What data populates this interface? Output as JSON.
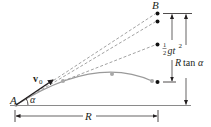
{
  "diagram": {
    "type": "projectile-motion",
    "labels": {
      "origin": "A",
      "target": "B",
      "velocity": "v",
      "velocity_sub": "0",
      "angle": "α",
      "range": "R",
      "drop_half": "1",
      "drop_den": "2",
      "drop_g": "gt",
      "drop_exp": "2",
      "height_R": "R",
      "height_tan": "tan",
      "height_alpha": "α"
    },
    "colors": {
      "ink": "#231f20",
      "trajectory": "#9a9a9a",
      "dashed": "#8a8a8a",
      "gray_dot": "#a8a8a8",
      "black_dot": "#111111"
    },
    "black_dots": [
      {
        "x": 157,
        "y": 13
      },
      {
        "x": 157,
        "y": 21
      },
      {
        "x": 157,
        "y": 44
      },
      {
        "x": 157,
        "y": 82
      }
    ],
    "gray_dots": [
      {
        "x": 63,
        "y": 81
      },
      {
        "x": 112,
        "y": 74
      },
      {
        "x": 152,
        "y": 81
      }
    ]
  }
}
